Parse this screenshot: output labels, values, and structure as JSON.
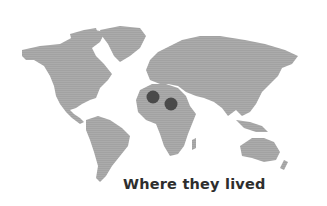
{
  "map": {
    "type": "world-map",
    "land_color": "#a9a9a9",
    "land_light_color": "#c4c4c4",
    "markers": [
      {
        "label": "marker-1",
        "cx": 153,
        "cy": 97,
        "r": 6.5,
        "color": "#4a4a4a"
      },
      {
        "label": "marker-2",
        "cx": 171,
        "cy": 104,
        "r": 6.5,
        "color": "#4a4a4a"
      }
    ]
  },
  "caption": "Where they lived"
}
